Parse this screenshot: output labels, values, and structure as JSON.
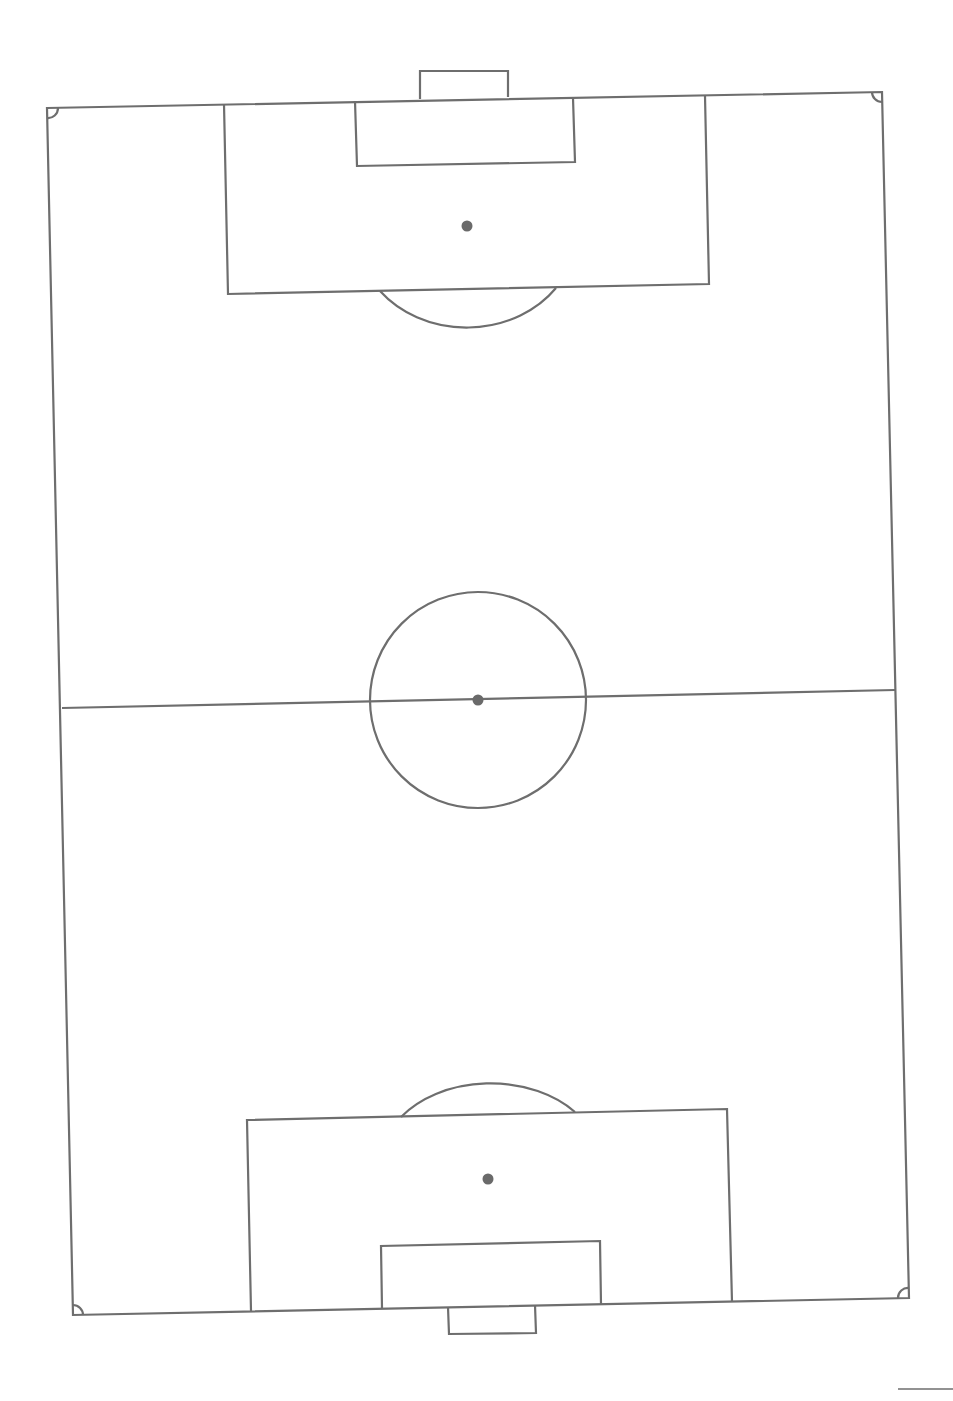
{
  "diagram": {
    "type": "soccer-field",
    "orientation": "portrait",
    "line_color": "#6e6e6e",
    "background": "#ffffff",
    "elements": [
      "touchlines",
      "goal-lines",
      "halfway-line",
      "center-circle",
      "center-spot",
      "penalty-areas",
      "goal-areas",
      "penalty-spots",
      "penalty-arcs",
      "corner-arcs",
      "goals"
    ]
  }
}
